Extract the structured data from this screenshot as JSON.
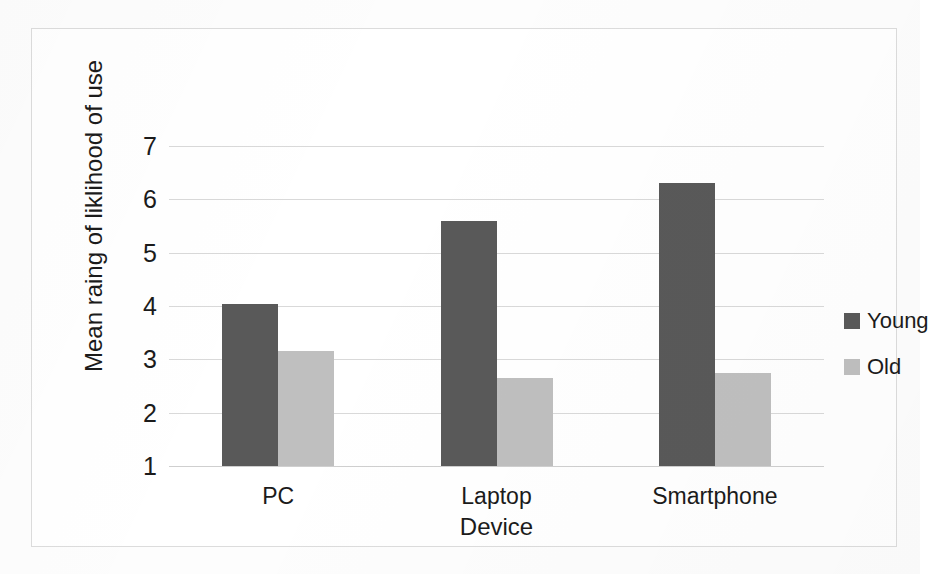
{
  "chart_data": {
    "type": "bar",
    "title": "",
    "xlabel": "Device",
    "ylabel": "Mean raing of liklihood of use",
    "categories": [
      "PC",
      "Laptop",
      "Smartphone"
    ],
    "series": [
      {
        "name": "Young",
        "color": "#595959",
        "values": [
          4.03,
          5.6,
          6.3
        ]
      },
      {
        "name": "Old",
        "color": "#bfbfbf",
        "values": [
          3.15,
          2.65,
          2.75
        ]
      }
    ],
    "yticks": [
      7,
      6,
      5,
      4,
      3,
      2,
      1
    ],
    "ylim": [
      1,
      7
    ],
    "grid": true,
    "legend_position": "right"
  },
  "legend": {
    "entries": [
      {
        "label": "Young",
        "swatch": "#595959"
      },
      {
        "label": "Old",
        "swatch": "#bfbfbf"
      }
    ]
  }
}
